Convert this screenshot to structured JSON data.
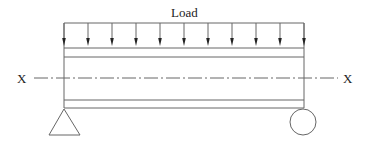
{
  "diagram": {
    "load_label": "Load",
    "axis_left_label": "X",
    "axis_right_label": "X",
    "arrow_count": 11,
    "supports": {
      "left": "pin-triangle",
      "right": "roller-circle"
    },
    "colors": {
      "line": "#555555",
      "text": "#222222",
      "background": "#ffffff"
    }
  }
}
